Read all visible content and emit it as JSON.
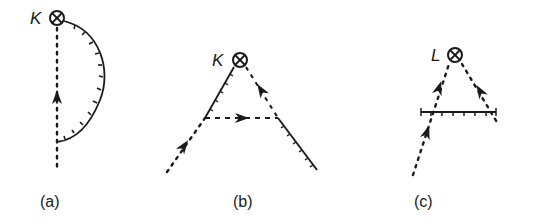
{
  "figure": {
    "ink_color": "#1a1a1a",
    "background": "#ffffff",
    "panels": [
      {
        "id": "a",
        "caption": "(a)",
        "caption_pos": [
          52,
          205
        ],
        "vertex": {
          "symbol": "otimes",
          "label": "K",
          "center": [
            57,
            18
          ],
          "radius": 7,
          "label_pos": [
            30,
            24
          ]
        },
        "dotted_lines": [
          {
            "from": [
              57,
              28
            ],
            "to": [
              57,
              172
            ],
            "arrow_at": [
              57,
              98
            ],
            "arrow_dir": "up"
          }
        ],
        "dashed_lines": [],
        "ticked_curves": [
          {
            "path": "M64,21 C100,30 112,70 100,100 C90,125 75,140 57,142"
          }
        ],
        "ticked_lines": []
      },
      {
        "id": "b",
        "caption": "(b)",
        "caption_pos": [
          245,
          205
        ],
        "vertex": {
          "symbol": "otimes",
          "label": "K",
          "center": [
            240,
            60
          ],
          "radius": 7,
          "label_pos": [
            213,
            66
          ]
        },
        "dotted_lines": [
          {
            "from": [
              167,
              172
            ],
            "to": [
              205,
              118
            ],
            "arrow_at": [
              184,
              147
            ],
            "arrow_dir": "up-right"
          }
        ],
        "dashed_lines": [
          {
            "from": [
              205,
              118
            ],
            "to": [
              278,
              118
            ],
            "arrow_at": [
              241,
              118
            ],
            "arrow_dir": "right"
          },
          {
            "from": [
              246,
              67
            ],
            "to": [
              278,
              118
            ],
            "arrow_at": [
              262,
              92
            ],
            "arrow_dir": "up-left"
          }
        ],
        "ticked_curves": [],
        "ticked_lines": [
          {
            "from": [
              205,
              118
            ],
            "to": [
              234,
              67
            ]
          },
          {
            "from": [
              278,
              118
            ],
            "to": [
              317,
              170
            ]
          }
        ]
      },
      {
        "id": "c",
        "caption": "(c)",
        "caption_pos": [
          425,
          205
        ],
        "vertex": {
          "symbol": "otimes",
          "label": "L",
          "center": [
            455,
            55
          ],
          "radius": 7,
          "label_pos": [
            430,
            61
          ]
        },
        "dotted_lines": [
          {
            "from": [
              415,
              175
            ],
            "to": [
              421,
              112
            ],
            "arrow_at": [
              433,
              147
            ],
            "arrow_dir": "up-right",
            "via": [
              [
                421,
                112
              ]
            ]
          },
          {
            "from": [
              421,
              112
            ],
            "to": [
              449,
              64
            ],
            "arrow_at": [
              437,
              86
            ],
            "arrow_dir": "up-right"
          },
          {
            "from": [
              462,
              64
            ],
            "to": [
              497,
              122
            ],
            "arrow_at": [
              480,
              91
            ],
            "arrow_dir": "up-left"
          }
        ],
        "dashed_lines": [],
        "ticked_curves": [],
        "ticked_lines": [
          {
            "from": [
              421,
              112
            ],
            "to": [
              496,
              112
            ]
          }
        ]
      }
    ]
  },
  "captions": {
    "a": "(a)",
    "b": "(b)",
    "c": "(c)"
  },
  "vertex_labels": {
    "a": "K",
    "b": "K",
    "c": "L"
  }
}
